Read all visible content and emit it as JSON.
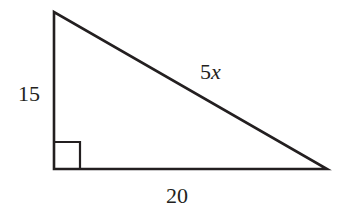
{
  "figure": {
    "type": "right-triangle",
    "stroke_color": "#231f20",
    "background": "#ffffff",
    "vertices": {
      "top": [
        54,
        12
      ],
      "right_angle": [
        54,
        169
      ],
      "right": [
        327,
        169
      ]
    },
    "right_angle_marker": true,
    "labels": {
      "vertical_leg": "15",
      "hypotenuse_coef": "5",
      "hypotenuse_var": "x",
      "horizontal_leg": "20"
    }
  }
}
